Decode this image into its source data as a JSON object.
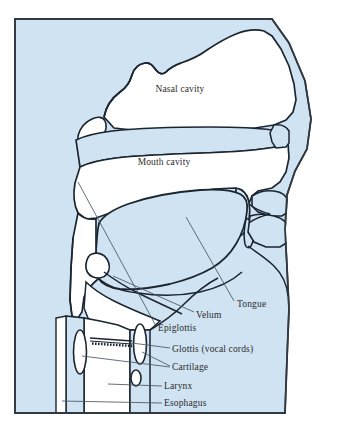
{
  "figure": {
    "frame": {
      "border_color": "#303842",
      "tissue_color": "#cfe3f2",
      "cavity_color": "#ffffff",
      "outline_color": "#1b2530",
      "leader_color": "#4a5560",
      "text_color": "#2b2b2b",
      "page_background": "#ffffff"
    },
    "labels": [
      {
        "id": "nasal-cavity",
        "text": "Nasal cavity",
        "x": 180,
        "y": 92,
        "anchor": "middle",
        "has_leader": false
      },
      {
        "id": "mouth-cavity",
        "text": "Mouth cavity",
        "x": 164,
        "y": 165,
        "anchor": "middle",
        "has_leader": false
      },
      {
        "id": "tongue",
        "text": "Tongue",
        "x": 237,
        "y": 307,
        "anchor": "start",
        "has_leader": true
      },
      {
        "id": "velum",
        "text": "Velum",
        "x": 196,
        "y": 318,
        "anchor": "start",
        "has_leader": true
      },
      {
        "id": "epiglottis",
        "text": "Epiglottis",
        "x": 158,
        "y": 331,
        "anchor": "start",
        "has_leader": true
      },
      {
        "id": "glottis",
        "text": "Glottis (vocal cords)",
        "x": 172,
        "y": 352,
        "anchor": "start",
        "has_leader": true
      },
      {
        "id": "cartilage",
        "text": "Cartilage",
        "x": 172,
        "y": 370,
        "anchor": "start",
        "has_leader": true
      },
      {
        "id": "larynx",
        "text": "Larynx",
        "x": 164,
        "y": 389,
        "anchor": "start",
        "has_leader": true
      },
      {
        "id": "esophagus",
        "text": "Esophagus",
        "x": 164,
        "y": 406,
        "anchor": "start",
        "has_leader": true
      }
    ],
    "structures": [
      "head-tissue",
      "nasal-cavity-space",
      "hard-palate",
      "soft-palate-velum",
      "uvula",
      "tongue-body",
      "pharynx",
      "epiglottis-flap",
      "vocal-folds",
      "thyroid-cartilage-left",
      "thyroid-cartilage-right",
      "cricoid-cartilage",
      "trachea",
      "esophagus-tube",
      "upper-lip",
      "lower-lip",
      "nose"
    ]
  }
}
